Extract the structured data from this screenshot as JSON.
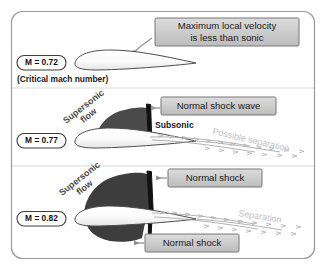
{
  "figure": {
    "background_color": "#ffffff",
    "border_color": "#9a9a9a"
  },
  "panels": [
    {
      "id": "panel-mach-072",
      "mach_badge": "M = 0.72",
      "caption": "(Critical mach number)",
      "callouts": [
        {
          "id": "callout-max-local-velocity",
          "line1": "Maximum local velocity",
          "line2": "is less than sonic"
        }
      ],
      "flow_labels": [],
      "separation_label": null,
      "supersonic_region": false
    },
    {
      "id": "panel-mach-077",
      "mach_badge": "M = 0.77",
      "caption": null,
      "callouts": [
        {
          "id": "callout-normal-shock-wave",
          "line1": "Normal shock wave",
          "line2": ""
        }
      ],
      "flow_labels": [
        {
          "id": "label-supersonic-flow",
          "line1": "Supersonic",
          "line2": "flow"
        },
        {
          "id": "label-subsonic",
          "line1": "Subsonic",
          "line2": ""
        }
      ],
      "separation_label": "Possible separation",
      "supersonic_region": true
    },
    {
      "id": "panel-mach-082",
      "mach_badge": "M = 0.82",
      "caption": null,
      "callouts": [
        {
          "id": "callout-normal-shock-upper",
          "line1": "Normal shock",
          "line2": ""
        },
        {
          "id": "callout-normal-shock-lower",
          "line1": "Normal shock",
          "line2": ""
        }
      ],
      "flow_labels": [
        {
          "id": "label-supersonic-flow",
          "line1": "Supersonic",
          "line2": "flow"
        }
      ],
      "separation_label": "Separation",
      "supersonic_region": true
    }
  ],
  "colors": {
    "supersonic_fill": "#4a4a4a",
    "shock_line": "#111111",
    "callout_fill": "#c9c9c9",
    "separation_text": "#c2c2c2",
    "airfoil_outline": "#4d4d4d"
  }
}
